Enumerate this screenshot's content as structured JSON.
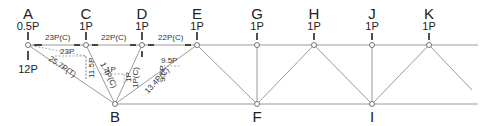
{
  "nodes": {
    "A": {
      "label": "A",
      "load": "0.5P",
      "reaction": "12P"
    },
    "C": {
      "label": "C",
      "load": "1P"
    },
    "D": {
      "label": "D",
      "load": "1P"
    },
    "E": {
      "label": "E",
      "load": "1P"
    },
    "G": {
      "label": "G",
      "load": "1P"
    },
    "H": {
      "label": "H",
      "load": "1P"
    },
    "J": {
      "label": "J",
      "load": "1P"
    },
    "K": {
      "label": "K",
      "load": "1P"
    },
    "B": {
      "label": "B"
    },
    "F": {
      "label": "F"
    },
    "I": {
      "label": "I"
    }
  },
  "member_forces": {
    "AC": "23P(C)",
    "CD": "22P(C)",
    "DE": "22P(C)",
    "AB": "25.7P(T)",
    "CB": "1.4P(C)",
    "DB": "1P(C)",
    "EB": "13.4P(C)"
  },
  "components": {
    "AB_horizontal": "23P",
    "AB_vertical": "11.5P",
    "CB_horizontal": "1P",
    "CB_vertical": "1P",
    "EB_horizontal": "9.5P",
    "EB_vertical": "9.5P"
  }
}
